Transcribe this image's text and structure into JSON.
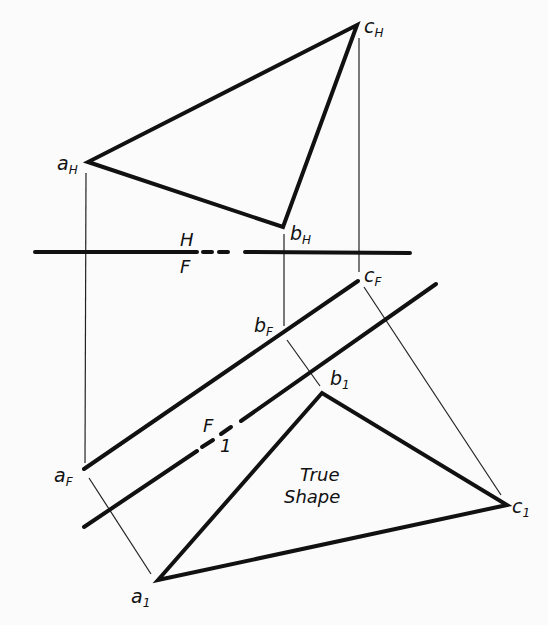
{
  "figure": {
    "type": "descriptive-geometry auxiliary view",
    "caption_in_figure": [
      "True",
      "Shape"
    ],
    "colors": {
      "ink": "#111111",
      "paper": "#fbfbfb"
    }
  },
  "fold_lines": {
    "hf": {
      "upper": "H",
      "lower": "F"
    },
    "f1": {
      "upper": "F",
      "lower": "1"
    }
  },
  "points": {
    "a_H": {
      "letter": "a",
      "sub": "H"
    },
    "b_H": {
      "letter": "b",
      "sub": "H"
    },
    "c_H": {
      "letter": "c",
      "sub": "H"
    },
    "a_F": {
      "letter": "a",
      "sub": "F"
    },
    "b_F": {
      "letter": "b",
      "sub": "F"
    },
    "c_F": {
      "letter": "c",
      "sub": "F"
    },
    "a_1": {
      "letter": "a",
      "sub": "1"
    },
    "b_1": {
      "letter": "b",
      "sub": "1"
    },
    "c_1": {
      "letter": "c",
      "sub": "1"
    }
  },
  "true_shape_label": {
    "line1": "True",
    "line2": "Shape"
  }
}
